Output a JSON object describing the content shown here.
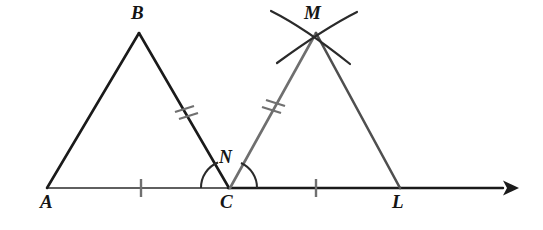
{
  "figure": {
    "kind": "geometry-diagram",
    "canvas": {
      "width": 543,
      "height": 230,
      "background": "#ffffff"
    },
    "colors": {
      "black": "#1a1a1a",
      "gray": "#6f6f6f",
      "baseline_left": "#5f5f5f",
      "baseline_right": "#1a1a1a",
      "tick": "#707070",
      "arc": "#2a2a2a",
      "label": "#151515"
    },
    "points": {
      "A": {
        "label": "A",
        "x": 47,
        "y": 188,
        "label_x": 40,
        "label_y": 192
      },
      "B": {
        "label": "B",
        "x": 139,
        "y": 33,
        "label_x": 131,
        "label_y": 3
      },
      "C": {
        "label": "C",
        "x": 228,
        "y": 188,
        "label_x": 220,
        "label_y": 192
      },
      "L": {
        "label": "L",
        "x": 400,
        "y": 188,
        "label_x": 392,
        "label_y": 192
      },
      "M": {
        "label": "M",
        "x": 316,
        "y": 33,
        "label_x": 304,
        "label_y": 3
      },
      "N": {
        "label": "N",
        "x": 229,
        "y": 160,
        "label_x": 219,
        "label_y": 148
      }
    },
    "baseline": {
      "name": "ray-AL",
      "start_x": 47,
      "end_x": 518,
      "y": 188,
      "arrowhead": "right",
      "left_segment_color": "#5f5f5f",
      "right_segment_color": "#1a1a1a"
    },
    "segments": [
      {
        "name": "segment-AB",
        "from": "A",
        "to": "B",
        "color": "#1a1a1a",
        "width": 2.4,
        "ticks": 0
      },
      {
        "name": "segment-BC",
        "from": "B",
        "to": "C",
        "color": "#1a1a1a",
        "width": 2.4,
        "ticks": 2
      },
      {
        "name": "segment-CM",
        "from": "C",
        "to": "M",
        "color": "#6f6f6f",
        "width": 2.4,
        "ticks": 2
      },
      {
        "name": "segment-ML",
        "from": "M",
        "to": "L",
        "color": "#4f4f4f",
        "width": 2.4,
        "ticks": 0
      },
      {
        "name": "segment-AC",
        "from": "A",
        "to": "C",
        "color": "#5f5f5f",
        "width": 2.2,
        "ticks": 1
      },
      {
        "name": "segment-CL",
        "from": "C",
        "to": "L",
        "color": "#1a1a1a",
        "width": 2.2,
        "ticks": 1
      }
    ],
    "tick_marks": [
      {
        "name": "tick-base-AC",
        "on": "segment-AC",
        "x": 141,
        "y": 188,
        "count": 1,
        "style": "single-vertical"
      },
      {
        "name": "tick-base-CL",
        "on": "segment-CL",
        "x": 316,
        "y": 188,
        "count": 1,
        "style": "single-vertical"
      },
      {
        "name": "tick-side-BC",
        "on": "segment-BC",
        "x": 185,
        "y": 112,
        "count": 2,
        "style": "double-slash"
      },
      {
        "name": "tick-side-CM",
        "on": "segment-CM",
        "x": 272,
        "y": 112,
        "count": 2,
        "style": "double-slash"
      }
    ],
    "angle_arcs": [
      {
        "name": "angle-arc-BCA",
        "at": "C",
        "radius": 27,
        "side": "left",
        "color": "#2a2a2a"
      },
      {
        "name": "angle-arc-MCL",
        "at": "C",
        "radius": 27,
        "side": "right",
        "color": "#2a2a2a"
      }
    ],
    "construction_arcs": [
      {
        "name": "construction-arc-left",
        "through": "M",
        "sweep": "down-right",
        "color": "#2a2a2a"
      },
      {
        "name": "construction-arc-right",
        "through": "M",
        "sweep": "down-left",
        "color": "#2a2a2a"
      }
    ]
  }
}
